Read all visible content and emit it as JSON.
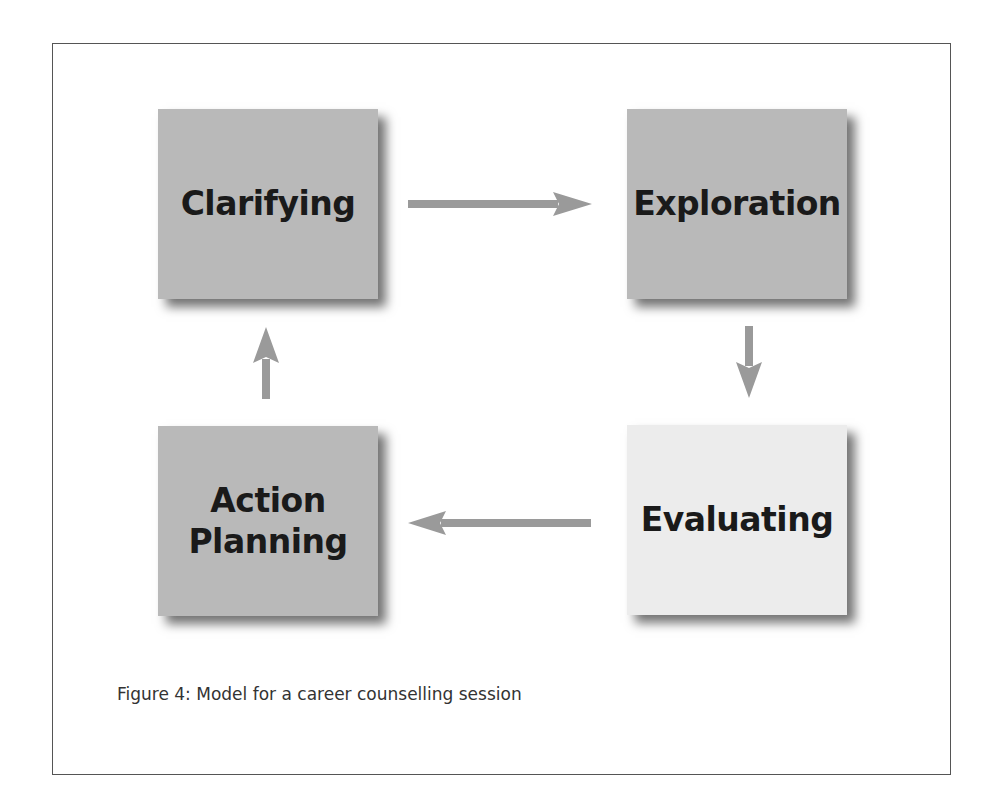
{
  "diagram": {
    "nodes": [
      {
        "id": "clarifying",
        "label": "Clarifying",
        "fill": "#b9b9b9"
      },
      {
        "id": "exploration",
        "label": "Exploration",
        "fill": "#b9b9b9"
      },
      {
        "id": "evaluating",
        "label": "Evaluating",
        "fill": "#ececec"
      },
      {
        "id": "action_planning",
        "label_line1": "Action",
        "label_line2": "Planning",
        "fill": "#b9b9b9"
      }
    ],
    "edges": [
      {
        "from": "Clarifying",
        "to": "Exploration",
        "direction": "right"
      },
      {
        "from": "Exploration",
        "to": "Evaluating",
        "direction": "down"
      },
      {
        "from": "Evaluating",
        "to": "Action Planning",
        "direction": "left"
      },
      {
        "from": "Action Planning",
        "to": "Clarifying",
        "direction": "up"
      }
    ],
    "arrow_color": "#9a9a9a"
  },
  "caption": "Figure 4: Model for a career counselling session"
}
